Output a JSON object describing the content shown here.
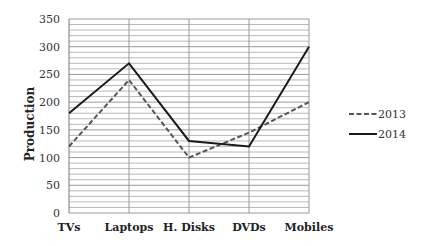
{
  "chart_data": {
    "type": "line",
    "title": "",
    "xlabel": "",
    "ylabel": "Production",
    "categories": [
      "TVs",
      "Laptops",
      "H. Disks",
      "DVDs",
      "Mobiles"
    ],
    "series": [
      {
        "name": "2013",
        "values": [
          120,
          240,
          100,
          145,
          200
        ],
        "color": "#555555",
        "style": "dashed"
      },
      {
        "name": "2014",
        "values": [
          180,
          270,
          130,
          120,
          300
        ],
        "color": "#1a1a1a",
        "style": "solid"
      }
    ],
    "ylim": [
      0,
      350
    ],
    "yticks": [
      0,
      50,
      100,
      150,
      200,
      250,
      300,
      350
    ],
    "minor_grid_step": 10,
    "grid": true,
    "legend_position": "right"
  },
  "legend": {
    "items": [
      {
        "label": "2013"
      },
      {
        "label": "2014"
      }
    ]
  }
}
